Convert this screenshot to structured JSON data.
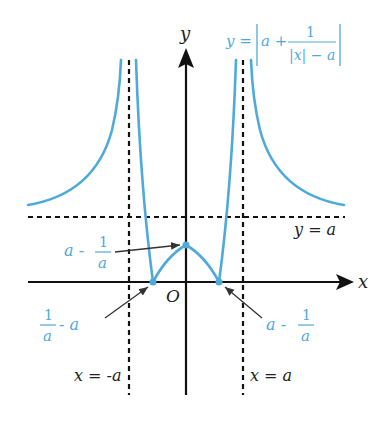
{
  "diagram": {
    "type": "function-graph",
    "colors": {
      "curve": "#4fa9d9",
      "axes": "#111111",
      "dashed": "#111111",
      "label_blue": "#4fa9d9"
    },
    "axes": {
      "x_label": "x",
      "y_label": "y",
      "origin_label": "O"
    },
    "equation": {
      "lhs": "y =",
      "a_plus": "a +",
      "numerator": "1",
      "denominator": "|x| − a"
    },
    "asymptotes": {
      "left_vertical": "x = -a",
      "right_vertical": "x = a",
      "horizontal": "y = a"
    },
    "annotations": {
      "peak": {
        "prefix": "a -",
        "num": "1",
        "den": "a"
      },
      "left_zero": {
        "num": "1",
        "den": "a",
        "suffix": "- a"
      },
      "right_zero": {
        "prefix": "a -",
        "num": "1",
        "den": "a"
      }
    }
  }
}
